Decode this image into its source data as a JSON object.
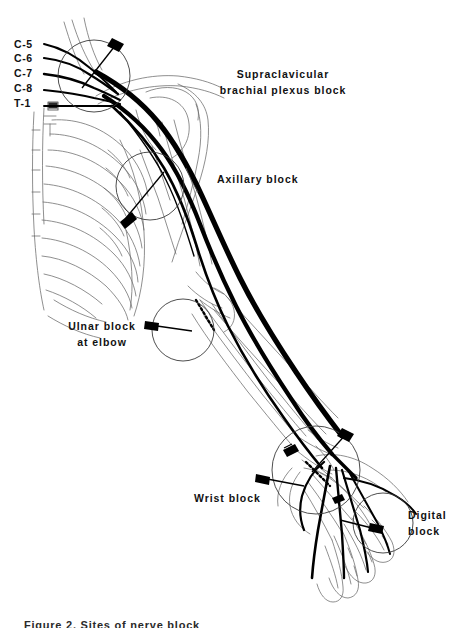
{
  "figure": {
    "background_color": "#ffffff",
    "ink_color": "#000000",
    "nerve_color": "#000000",
    "line_art_color": "#555555"
  },
  "nerve_roots": {
    "group_label": "cervical and thoracic nerve roots",
    "items": [
      {
        "label": "C-5"
      },
      {
        "label": "C-6"
      },
      {
        "label": "C-7"
      },
      {
        "label": "C-8"
      },
      {
        "label": "T-1"
      }
    ]
  },
  "blocks": [
    {
      "id": "supraclavicular",
      "line1": "Supraclavicular",
      "line2": "brachial plexus  block",
      "needle": "needle-supraclavicular"
    },
    {
      "id": "axillary",
      "line1": "Axillary block",
      "line2": "",
      "needle": "needle-axillary"
    },
    {
      "id": "ulnar-elbow",
      "line1": "Ulnar block",
      "line2": "at elbow",
      "needle": "needle-ulnar-elbow"
    },
    {
      "id": "wrist",
      "line1": "Wrist block",
      "line2": "",
      "needle": "needle-wrist"
    },
    {
      "id": "digital",
      "line1": "Digital",
      "line2": "block",
      "needle": "needle-digital"
    }
  ],
  "caption": {
    "text": "Figure  2.  Sites  of  nerve  block"
  }
}
